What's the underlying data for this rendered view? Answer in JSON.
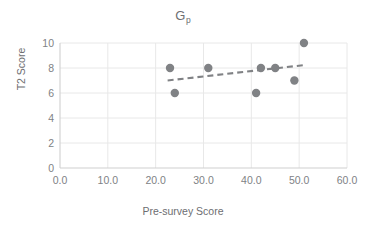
{
  "chart_data": {
    "type": "scatter",
    "title": "Gp",
    "title_base": "G",
    "title_subscript": "p",
    "xlabel": "Pre-survey Score",
    "ylabel": "T2 Score",
    "xlim": [
      0,
      60
    ],
    "ylim": [
      0,
      10
    ],
    "xticks": [
      0,
      10,
      20,
      30,
      40,
      50,
      60
    ],
    "yticks": [
      0,
      2,
      4,
      6,
      8,
      10
    ],
    "xtick_labels": [
      "0.0",
      "10.0",
      "20.0",
      "30.0",
      "40.0",
      "50.0",
      "60.0"
    ],
    "ytick_labels": [
      "0",
      "2",
      "4",
      "6",
      "8",
      "10"
    ],
    "grid": true,
    "grid_x": true,
    "grid_y": true,
    "legend": false,
    "series": [
      {
        "name": "T2 Score",
        "marker": "circle",
        "color": "#808285",
        "points": [
          {
            "x": 23,
            "y": 8
          },
          {
            "x": 24,
            "y": 6
          },
          {
            "x": 31,
            "y": 8
          },
          {
            "x": 41,
            "y": 6
          },
          {
            "x": 42,
            "y": 8
          },
          {
            "x": 45,
            "y": 8
          },
          {
            "x": 49,
            "y": 7
          },
          {
            "x": 51,
            "y": 10
          }
        ]
      }
    ],
    "trendline": {
      "type": "linear",
      "style": "dashed",
      "color": "#808285",
      "x_start": 22.5,
      "y_start": 7.0,
      "x_end": 51.5,
      "y_end": 8.25
    },
    "colors": {
      "marker": "#808285",
      "trendline": "#808285",
      "grid": "#e8e8e8",
      "axis": "#d0d0d0",
      "text": "#808285",
      "title_text": "#6d6e71",
      "background": "#ffffff"
    }
  }
}
